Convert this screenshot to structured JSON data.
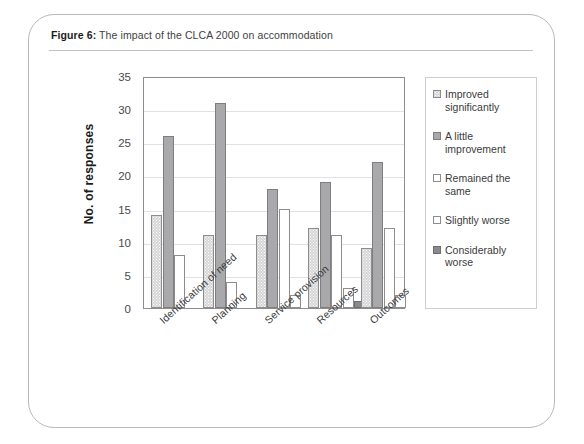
{
  "figure": {
    "caption_label": "Figure 6:",
    "caption_text": "The impact of the CLCA 2000 on accommodation"
  },
  "chart_data": {
    "type": "bar",
    "title": "The impact of the CLCA 2000 on accommodation",
    "xlabel": "",
    "ylabel": "No. of responses",
    "ylim": [
      0,
      35
    ],
    "ytick_step": 5,
    "yticks": [
      0,
      5,
      10,
      15,
      20,
      25,
      30,
      35
    ],
    "grid": true,
    "legend_position": "right",
    "categories": [
      "Identification of need",
      "Planning",
      "Service provision",
      "Resources",
      "Outcomes"
    ],
    "series": [
      {
        "name": "Improved significantly",
        "swatch": "#d6d6d6",
        "style": "dotted",
        "values": [
          14,
          11,
          11,
          12,
          9
        ]
      },
      {
        "name": "A little improvement",
        "swatch": "#a9a9ab",
        "style": "gray",
        "values": [
          26,
          31,
          18,
          19,
          22
        ]
      },
      {
        "name": "Remained the same",
        "swatch": "#ffffff",
        "style": "white",
        "values": [
          8,
          4,
          15,
          11,
          12
        ]
      },
      {
        "name": "Slightly worse",
        "swatch": "#ffffff",
        "style": "white",
        "values": [
          0,
          0,
          2,
          3,
          2
        ]
      },
      {
        "name": "Considerably worse",
        "swatch": "#8a8a8d",
        "style": "dark",
        "values": [
          0,
          0,
          0,
          1,
          0
        ]
      }
    ]
  }
}
